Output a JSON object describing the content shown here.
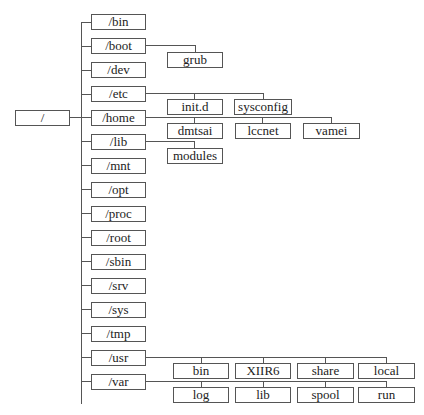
{
  "diagram": {
    "root": {
      "label": "/"
    },
    "level1": [
      {
        "label": "/bin"
      },
      {
        "label": "/boot"
      },
      {
        "label": "/dev"
      },
      {
        "label": "/etc"
      },
      {
        "label": "/home"
      },
      {
        "label": "/lib"
      },
      {
        "label": "/mnt"
      },
      {
        "label": "/opt"
      },
      {
        "label": "/proc"
      },
      {
        "label": "/root"
      },
      {
        "label": "/sbin"
      },
      {
        "label": "/srv"
      },
      {
        "label": "/sys"
      },
      {
        "label": "/tmp"
      },
      {
        "label": "/usr"
      },
      {
        "label": "/var"
      }
    ],
    "children": {
      "boot": [
        {
          "label": "grub"
        }
      ],
      "etc": [
        {
          "label": "init.d"
        },
        {
          "label": "sysconfig"
        }
      ],
      "home": [
        {
          "label": "dmtsai"
        },
        {
          "label": "lccnet"
        },
        {
          "label": "vamei"
        }
      ],
      "lib": [
        {
          "label": "modules"
        }
      ],
      "usr": [
        {
          "label": "bin"
        },
        {
          "label": "XIIR6"
        },
        {
          "label": "share"
        },
        {
          "label": "local"
        }
      ],
      "var": [
        {
          "label": "log"
        },
        {
          "label": "lib"
        },
        {
          "label": "spool"
        },
        {
          "label": "run"
        }
      ]
    },
    "colors": {
      "line": "#555555",
      "box_border": "#555555",
      "text": "#222222",
      "background": "#ffffff"
    }
  }
}
